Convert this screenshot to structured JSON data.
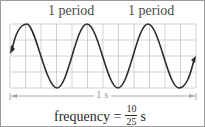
{
  "labels": {
    "period_1": "1 period",
    "period_2": "1 period",
    "duration": "1 s",
    "caption_prefix": "frequency =",
    "caption_numerator": "10",
    "caption_denominator": "25",
    "caption_unit": "s"
  },
  "colors": {
    "wave": "#2b2b2b",
    "grid": "#cfcfcf",
    "arrow_line": "#a8a8a8",
    "text": "#2a2a2a"
  },
  "diagram": {
    "grid_columns": 12,
    "grid_rows": 4,
    "periods_labeled": 2
  }
}
